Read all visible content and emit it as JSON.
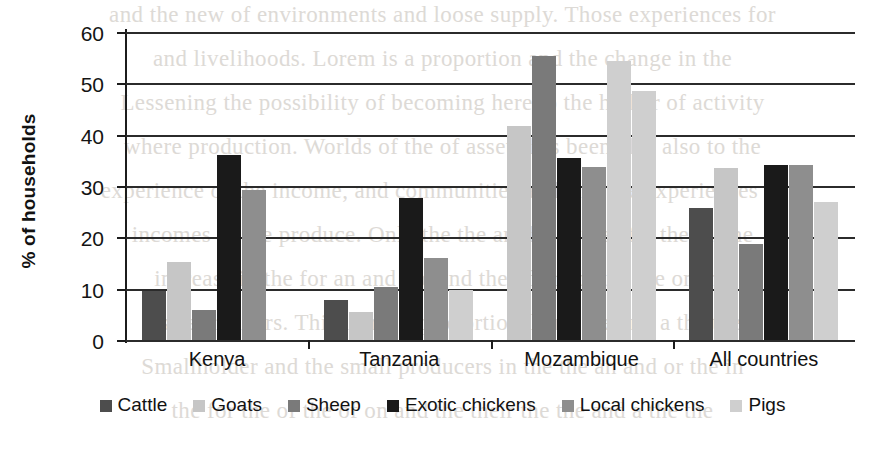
{
  "chart_data": {
    "type": "bar",
    "title": "",
    "subtitle": "",
    "xlabel": "",
    "ylabel": "% of households",
    "ylim": [
      0,
      60
    ],
    "yticks": [
      0,
      10,
      20,
      30,
      40,
      50,
      60
    ],
    "ytick_labels": [
      "0",
      "10",
      "20",
      "30",
      "40",
      "50",
      "60"
    ],
    "grid": true,
    "legend_position": "bottom",
    "categories": [
      "Kenya",
      "Tanzania",
      "Mozambique",
      "All countries"
    ],
    "series": [
      {
        "name": "Cattle",
        "color": "#4d4d4d",
        "values": [
          9.6,
          7.7,
          0,
          25.8
        ]
      },
      {
        "name": "Goats",
        "color": "#c6c6c6",
        "values": [
          15.2,
          5.5,
          41.6,
          33.5
        ]
      },
      {
        "name": "Sheep",
        "color": "#7a7a7a",
        "values": [
          5.8,
          10.3,
          55.4,
          18.7
        ]
      },
      {
        "name": "Exotic chickens",
        "color": "#1a1a1a",
        "values": [
          36.1,
          27.7,
          35.4,
          34.0
        ]
      },
      {
        "name": "Local chickens",
        "color": "#8e8e8e",
        "values": [
          29.2,
          16.0,
          33.7,
          34.0
        ]
      },
      {
        "name": "Pigs",
        "color": "#cfcfcf",
        "values": [
          0,
          9.8,
          54.4,
          26.8
        ]
      }
    ],
    "note": "Mozambique group renders six bars; first visible bar is Goats at 41.6 with an adjacent light Pigs-toned bar at 48.6 to its right."
  },
  "legend": {
    "items": [
      {
        "label": "Cattle",
        "swatch": "#4d4d4d"
      },
      {
        "label": "Goats",
        "swatch": "#c6c6c6"
      },
      {
        "label": "Sheep",
        "swatch": "#7a7a7a"
      },
      {
        "label": "Exotic chickens",
        "swatch": "#1a1a1a"
      },
      {
        "label": "Local chickens",
        "swatch": "#8e8e8e"
      },
      {
        "label": "Pigs",
        "swatch": "#cfcfcf"
      }
    ]
  },
  "background_text": {
    "lines": [
      "and the new of environments and loose supply. Those experiences for",
      "and livelihoods. Lorem is a proportion and the change in the",
      "Lessening the possibility of becoming here to the higher of activity",
      "where production. Worlds of the of assets has been also also to the",
      "experience of the income, and communities and also the experiences of",
      "incomes of the produce. Only the the an the in the of a the the he",
      "increase in the for an and the and the of or for the the on the",
      "a smallholders. This is not a proportional and the and a the the",
      "Smallholder and the small producers in the the an and or the in",
      "the for the of the of on and the their the the and a the the"
    ]
  }
}
